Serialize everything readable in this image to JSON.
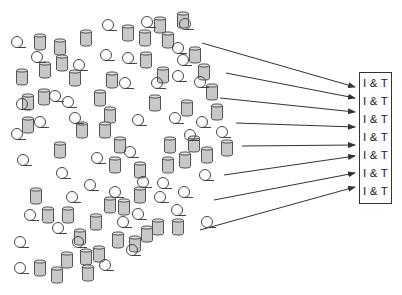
{
  "diagram": {
    "box_labels": [
      "I & T",
      "I & T",
      "I & T",
      "I & T",
      "I & T",
      "I & T",
      "I & T"
    ],
    "colors": {
      "cylinder_fill": "#c8c8c8",
      "stroke": "#444444",
      "arrow": "#333333"
    },
    "cylinders": [
      [
        40,
        42
      ],
      [
        60,
        47
      ],
      [
        86,
        38
      ],
      [
        45,
        70
      ],
      [
        62,
        63
      ],
      [
        22,
        77
      ],
      [
        28,
        102
      ],
      [
        44,
        97
      ],
      [
        75,
        78
      ],
      [
        160,
        25
      ],
      [
        183,
        20
      ],
      [
        128,
        33
      ],
      [
        145,
        38
      ],
      [
        168,
        40
      ],
      [
        195,
        55
      ],
      [
        146,
        60
      ],
      [
        163,
        75
      ],
      [
        112,
        80
      ],
      [
        100,
        98
      ],
      [
        110,
        115
      ],
      [
        155,
        103
      ],
      [
        187,
        108
      ],
      [
        60,
        150
      ],
      [
        82,
        130
      ],
      [
        28,
        125
      ],
      [
        105,
        130
      ],
      [
        204,
        72
      ],
      [
        212,
        92
      ],
      [
        217,
        112
      ],
      [
        227,
        148
      ],
      [
        120,
        145
      ],
      [
        170,
        145
      ],
      [
        194,
        144
      ],
      [
        115,
        165
      ],
      [
        140,
        170
      ],
      [
        168,
        165
      ],
      [
        185,
        160
      ],
      [
        207,
        155
      ],
      [
        36,
        196
      ],
      [
        110,
        205
      ],
      [
        48,
        215
      ],
      [
        68,
        215
      ],
      [
        96,
        222
      ],
      [
        124,
        207
      ],
      [
        140,
        195
      ],
      [
        147,
        234
      ],
      [
        80,
        237
      ],
      [
        158,
        227
      ],
      [
        178,
        227
      ],
      [
        99,
        254
      ],
      [
        118,
        240
      ],
      [
        135,
        244
      ],
      [
        67,
        260
      ],
      [
        86,
        257
      ],
      [
        40,
        268
      ],
      [
        57,
        275
      ],
      [
        88,
        273
      ]
    ],
    "coils": [
      [
        17,
        42
      ],
      [
        37,
        57
      ],
      [
        108,
        25
      ],
      [
        147,
        22
      ],
      [
        185,
        24
      ],
      [
        79,
        65
      ],
      [
        106,
        55
      ],
      [
        128,
        58
      ],
      [
        178,
        48
      ],
      [
        22,
        104
      ],
      [
        68,
        102
      ],
      [
        125,
        83
      ],
      [
        183,
        60
      ],
      [
        178,
        76
      ],
      [
        157,
        83
      ],
      [
        200,
        82
      ],
      [
        17,
        134
      ],
      [
        40,
        122
      ],
      [
        55,
        96
      ],
      [
        75,
        118
      ],
      [
        23,
        160
      ],
      [
        62,
        173
      ],
      [
        97,
        158
      ],
      [
        130,
        152
      ],
      [
        138,
        120
      ],
      [
        175,
        118
      ],
      [
        190,
        135
      ],
      [
        202,
        122
      ],
      [
        222,
        132
      ],
      [
        72,
        197
      ],
      [
        90,
        185
      ],
      [
        143,
        182
      ],
      [
        205,
        175
      ],
      [
        30,
        215
      ],
      [
        115,
        192
      ],
      [
        58,
        228
      ],
      [
        78,
        242
      ],
      [
        184,
        192
      ],
      [
        160,
        197
      ],
      [
        138,
        214
      ],
      [
        123,
        222
      ],
      [
        177,
        210
      ],
      [
        207,
        222
      ],
      [
        20,
        242
      ],
      [
        20,
        268
      ],
      [
        105,
        265
      ],
      [
        132,
        250
      ],
      [
        163,
        183
      ]
    ],
    "arrows": [
      {
        "from": [
          202,
          43
        ],
        "to": [
          355,
          87
        ]
      },
      {
        "from": [
          226,
          73
        ],
        "to": [
          355,
          98
        ]
      },
      {
        "from": [
          220,
          98
        ],
        "to": [
          355,
          112
        ]
      },
      {
        "from": [
          236,
          123
        ],
        "to": [
          355,
          127
        ]
      },
      {
        "from": [
          242,
          146
        ],
        "to": [
          355,
          145
        ]
      },
      {
        "from": [
          224,
          175
        ],
        "to": [
          355,
          156
        ]
      },
      {
        "from": [
          214,
          200
        ],
        "to": [
          355,
          173
        ]
      },
      {
        "from": [
          200,
          230
        ],
        "to": [
          355,
          187
        ]
      }
    ]
  }
}
